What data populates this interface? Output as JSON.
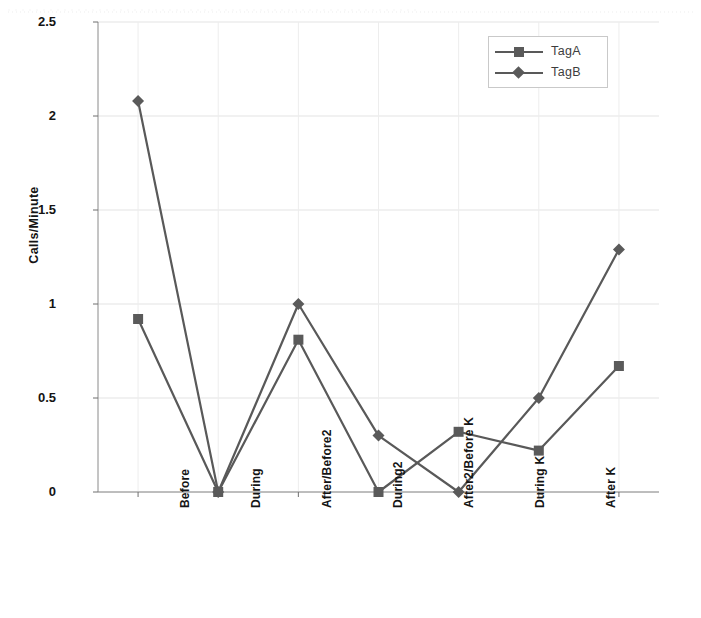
{
  "chart_data": {
    "type": "line",
    "title": "",
    "xlabel": "",
    "ylabel": "Calls/Minute",
    "categories": [
      "Before",
      "During",
      "After/Before2",
      "During2",
      "After2/Before K",
      "During K",
      "After K"
    ],
    "series": [
      {
        "name": "TagA",
        "marker": "square",
        "values": [
          0.92,
          0.0,
          0.81,
          0.0,
          0.32,
          0.22,
          0.67
        ]
      },
      {
        "name": "TagB",
        "marker": "diamond",
        "values": [
          2.08,
          0.0,
          1.0,
          0.3,
          0.0,
          0.5,
          1.29
        ]
      }
    ],
    "ylim": [
      0,
      2.5
    ],
    "y_ticks": [
      "0",
      "0.5",
      "1",
      "1.5",
      "2",
      "2.5"
    ],
    "y_tick_values": [
      0,
      0.5,
      1,
      1.5,
      2,
      2.5
    ],
    "grid": true,
    "legend_position": "top-right",
    "line_color": "#595959",
    "marker_color": "#5a5a5a",
    "grid_color": "#e3e3e3"
  },
  "axis": {
    "y_title": "Calls/Minute",
    "y_labels": [
      "2.5",
      "2",
      "1.5",
      "1",
      "0.5",
      "0"
    ],
    "x_labels": [
      "Before",
      "During",
      "After/Before2",
      "During2",
      "After2/Before K",
      "During K",
      "After K"
    ]
  },
  "legend": {
    "items": [
      {
        "label": "TagA",
        "marker": "square-marker"
      },
      {
        "label": "TagB",
        "marker": "diamond-marker"
      }
    ]
  }
}
